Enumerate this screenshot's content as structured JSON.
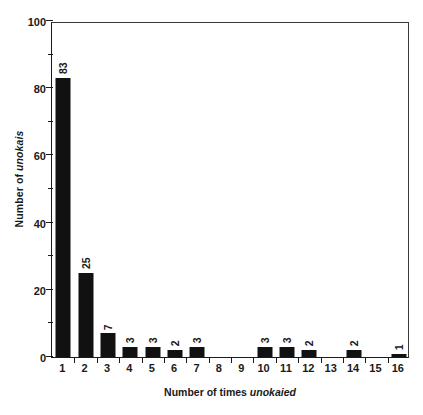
{
  "chart_data": {
    "type": "bar",
    "title": "",
    "subtitle": "",
    "xlabel_plain": "Number of times ",
    "xlabel_italic": "unokaied",
    "ylabel_plain": "Number of ",
    "ylabel_italic": "unokais",
    "categories": [
      "1",
      "2",
      "3",
      "4",
      "5",
      "6",
      "7",
      "8",
      "9",
      "10",
      "11",
      "12",
      "13",
      "14",
      "15",
      "16"
    ],
    "values": [
      83,
      25,
      7,
      3,
      3,
      2,
      3,
      0,
      0,
      3,
      3,
      2,
      0,
      2,
      0,
      1
    ],
    "bar_labels": [
      "83",
      "25",
      "7",
      "3",
      "3",
      "2",
      "3",
      "",
      "",
      "3",
      "3",
      "2",
      "",
      "2",
      "",
      "1"
    ],
    "ylim": [
      0,
      100
    ],
    "xlim_categories": 16,
    "y_major_ticks": [
      0,
      20,
      40,
      60,
      80,
      100
    ],
    "y_major_tick_labels": [
      "0",
      "20",
      "40",
      "60",
      "80",
      "100"
    ],
    "y_minor_ticks": [
      10,
      30,
      50,
      70,
      90
    ],
    "grid": false,
    "legend": false,
    "legend_position": "none",
    "bar_color": "#111111",
    "axis_color": "#1a1a1a",
    "background_color": "#ffffff",
    "orientation": "vertical",
    "value_label_rotation_deg": -90
  }
}
